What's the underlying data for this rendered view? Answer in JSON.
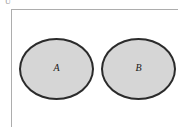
{
  "figure": {
    "type": "venn-diagram",
    "background_color": "#ffffff"
  },
  "corner_mark": {
    "glyph": "U",
    "color": "#9a9a9a"
  },
  "frame": {
    "name": "universal-set-rectangle",
    "border_color": "#adadad",
    "border_width_px": 1,
    "visible_edges": "top-and-left"
  },
  "sets": [
    {
      "id": "a",
      "label": "A",
      "fill_color": "#d6d6d6",
      "stroke_color": "#2b2b2b",
      "stroke_width_px": 2,
      "x_px": 19,
      "y_px": 38,
      "width_px": 75,
      "height_px": 62
    },
    {
      "id": "b",
      "label": "B",
      "fill_color": "#d6d6d6",
      "stroke_color": "#2b2b2b",
      "stroke_width_px": 2,
      "x_px": 101,
      "y_px": 38,
      "width_px": 75,
      "height_px": 62
    }
  ]
}
